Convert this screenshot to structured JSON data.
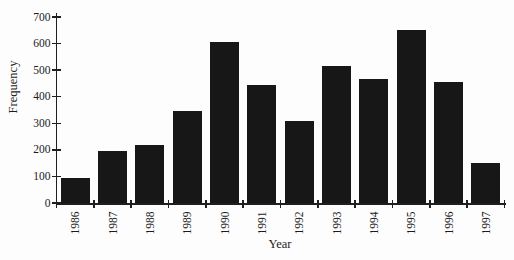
{
  "figure": {
    "background": "#fdfdfd",
    "bar_color": "#171717",
    "axis_color": "#1f1f1f",
    "text_color": "#1b1b1b"
  },
  "chart_data": {
    "type": "bar",
    "title": "",
    "xlabel": "Year",
    "ylabel": "Frequency",
    "categories": [
      "1986",
      "1987",
      "1988",
      "1989",
      "1990",
      "1991",
      "1992",
      "1993",
      "1994",
      "1995",
      "1996",
      "1997"
    ],
    "values": [
      95,
      195,
      220,
      345,
      605,
      445,
      310,
      515,
      465,
      650,
      455,
      150
    ],
    "ylim": [
      0,
      700
    ],
    "yticks": [
      0,
      100,
      200,
      300,
      400,
      500,
      600,
      700
    ],
    "ytick_interval": 100,
    "grid": false,
    "legend": false,
    "x_tick_label_rotation": -90,
    "bar_style": "solid-black"
  }
}
